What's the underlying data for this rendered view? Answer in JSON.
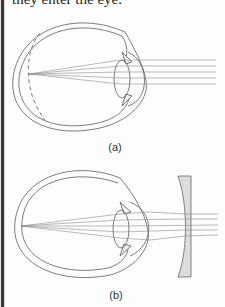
{
  "text": {
    "top_line": "they enter the eye."
  },
  "figures": [
    {
      "id": "a",
      "label": "(a)",
      "description": "Myopic eye: parallel rays focus in front of retina (dashed line shows normal retina position)"
    },
    {
      "id": "b",
      "label": "(b)",
      "description": "Myopia corrected by diverging (concave) lens placed in front of eye"
    }
  ],
  "colors": {
    "line": "#555555",
    "ray": "#8a8a8a",
    "lens_fill": "#dcdcdc",
    "background": "#fdfdfd"
  }
}
